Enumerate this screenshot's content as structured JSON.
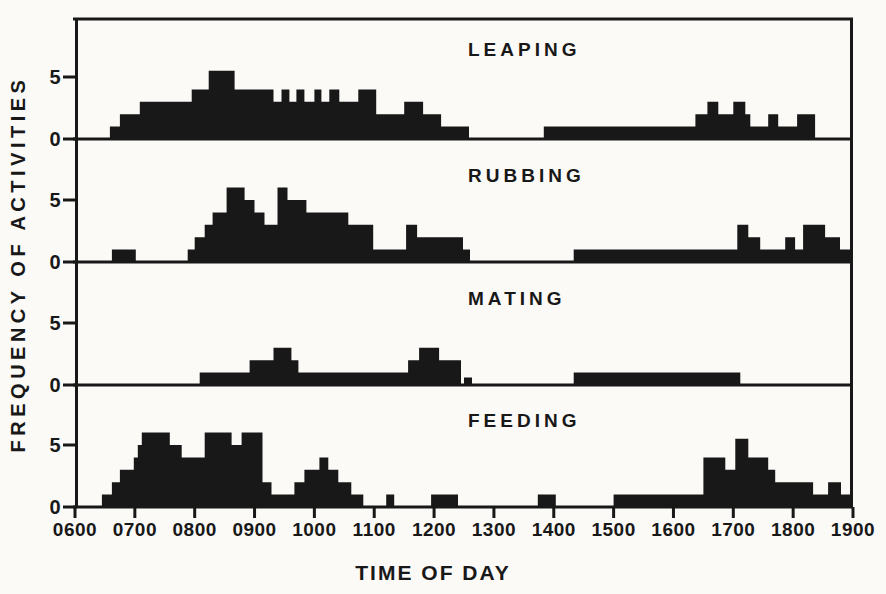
{
  "figure": {
    "xlabel": "TIME OF DAY",
    "ylabel": "FREQUENCY OF ACTIVITIES",
    "ink_color": "#181818",
    "bg_color": "#fbfaf7"
  },
  "chart_data": {
    "type": "area",
    "subtype": "step-histogram-stack",
    "x_unit": "minutes after 0600",
    "x_range_minutes": [
      0,
      780
    ],
    "x_ticks": [
      "0600",
      "0700",
      "0800",
      "0900",
      "1000",
      "1100",
      "1200",
      "1300",
      "1400",
      "1500",
      "1600",
      "1700",
      "1800",
      "1900"
    ],
    "y_tick_values": [
      5,
      0
    ],
    "y_tick_labels": [
      "5",
      "0"
    ],
    "y_max": 7,
    "grid": false,
    "legend": "none",
    "panels": [
      {
        "label": "LEAPING",
        "segments": [
          [
            35,
            45,
            1
          ],
          [
            45,
            65,
            2
          ],
          [
            65,
            117,
            3
          ],
          [
            117,
            134,
            4
          ],
          [
            134,
            160,
            5.5
          ],
          [
            160,
            199,
            4
          ],
          [
            199,
            207,
            3
          ],
          [
            207,
            215,
            4
          ],
          [
            215,
            222,
            3
          ],
          [
            222,
            230,
            4
          ],
          [
            230,
            240,
            3
          ],
          [
            240,
            247,
            4
          ],
          [
            247,
            255,
            3
          ],
          [
            255,
            265,
            4
          ],
          [
            265,
            284,
            3
          ],
          [
            284,
            302,
            4
          ],
          [
            302,
            330,
            2
          ],
          [
            330,
            349,
            3
          ],
          [
            349,
            367,
            2
          ],
          [
            367,
            395,
            1
          ],
          [
            470,
            622,
            1
          ],
          [
            622,
            634,
            2
          ],
          [
            634,
            645,
            3
          ],
          [
            645,
            660,
            2
          ],
          [
            660,
            672,
            3
          ],
          [
            672,
            677,
            2
          ],
          [
            677,
            695,
            1
          ],
          [
            695,
            705,
            2
          ],
          [
            705,
            724,
            1
          ],
          [
            724,
            742,
            2
          ]
        ]
      },
      {
        "label": "RUBBING",
        "segments": [
          [
            37,
            61,
            1
          ],
          [
            113,
            120,
            1
          ],
          [
            120,
            130,
            2
          ],
          [
            130,
            138,
            3
          ],
          [
            138,
            152,
            4
          ],
          [
            152,
            170,
            6
          ],
          [
            170,
            180,
            5
          ],
          [
            180,
            190,
            4
          ],
          [
            190,
            203,
            3
          ],
          [
            203,
            213,
            6
          ],
          [
            213,
            232,
            5
          ],
          [
            232,
            274,
            4
          ],
          [
            274,
            299,
            3
          ],
          [
            299,
            332,
            1
          ],
          [
            332,
            343,
            3
          ],
          [
            343,
            389,
            2
          ],
          [
            389,
            396,
            1
          ],
          [
            500,
            664,
            1
          ],
          [
            664,
            675,
            3
          ],
          [
            675,
            687,
            2
          ],
          [
            687,
            712,
            1
          ],
          [
            712,
            722,
            2
          ],
          [
            722,
            730,
            1
          ],
          [
            730,
            752,
            3
          ],
          [
            752,
            767,
            2
          ],
          [
            767,
            780,
            1
          ]
        ]
      },
      {
        "label": "MATING",
        "segments": [
          [
            125,
            175,
            1
          ],
          [
            175,
            199,
            2
          ],
          [
            199,
            217,
            3
          ],
          [
            217,
            224,
            2
          ],
          [
            224,
            334,
            1
          ],
          [
            334,
            345,
            2
          ],
          [
            345,
            365,
            3
          ],
          [
            365,
            387,
            2
          ],
          [
            390,
            398,
            0.6
          ],
          [
            500,
            667,
            1
          ]
        ]
      },
      {
        "label": "FEEDING",
        "segments": [
          [
            27,
            37,
            1
          ],
          [
            37,
            45,
            2
          ],
          [
            45,
            59,
            3
          ],
          [
            59,
            63,
            4
          ],
          [
            63,
            67,
            5
          ],
          [
            67,
            95,
            6
          ],
          [
            95,
            107,
            5
          ],
          [
            107,
            130,
            4
          ],
          [
            130,
            157,
            6
          ],
          [
            157,
            167,
            5
          ],
          [
            167,
            188,
            6
          ],
          [
            188,
            197,
            2
          ],
          [
            197,
            220,
            1
          ],
          [
            220,
            230,
            2
          ],
          [
            230,
            245,
            3
          ],
          [
            245,
            254,
            4
          ],
          [
            254,
            264,
            3
          ],
          [
            264,
            277,
            2
          ],
          [
            277,
            289,
            1
          ],
          [
            312,
            320,
            1
          ],
          [
            357,
            384,
            1
          ],
          [
            464,
            482,
            1
          ],
          [
            540,
            630,
            1
          ],
          [
            630,
            652,
            4
          ],
          [
            652,
            662,
            3
          ],
          [
            662,
            675,
            5.5
          ],
          [
            675,
            695,
            4
          ],
          [
            695,
            702,
            3
          ],
          [
            702,
            740,
            2
          ],
          [
            740,
            755,
            1
          ],
          [
            755,
            768,
            2
          ],
          [
            768,
            780,
            1
          ]
        ]
      }
    ]
  }
}
